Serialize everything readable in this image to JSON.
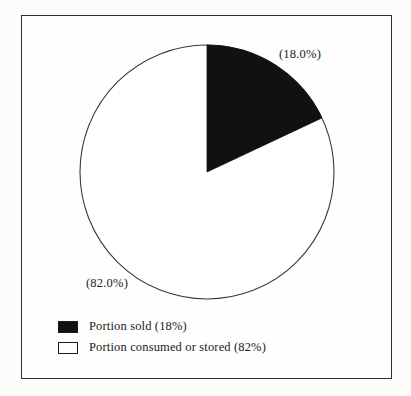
{
  "chart_data": {
    "type": "pie",
    "title": "",
    "subtitle": "",
    "xlabel": "",
    "ylabel": "",
    "grid": false,
    "legend_position": "bottom-left",
    "start_angle_deg": 0,
    "direction": "clockwise",
    "categories": [
      "Portion sold",
      "Portion consumed or stored"
    ],
    "values": [
      18.0,
      82.0
    ],
    "slices": [
      {
        "name": "Portion sold",
        "value": 18.0,
        "callout": "(18.0%)",
        "legend_label": "Portion sold (18%)",
        "color": "#111111",
        "swatch_style": "filled"
      },
      {
        "name": "Portion consumed or stored",
        "value": 82.0,
        "callout": "(82.0%)",
        "legend_label": "Portion consumed or stored (82%)",
        "color": "#ffffff",
        "swatch_style": "hollow"
      }
    ],
    "annotations": [
      "(18.0%)",
      "(82.0%)"
    ]
  },
  "figure": {
    "border_color": "#2e2e2e",
    "background": "#fefefe",
    "pie_stroke_color": "#3a3a3a"
  },
  "legend": {
    "items": [
      {
        "label": "Portion sold (18%)"
      },
      {
        "label": "Portion consumed or stored (82%)"
      }
    ]
  }
}
